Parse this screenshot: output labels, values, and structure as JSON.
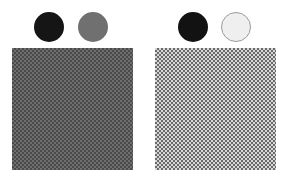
{
  "left_group": {
    "swatch_a": {
      "color": "#151515",
      "label": "dark swatch"
    },
    "swatch_b": {
      "color": "#707070",
      "label": "mid-gray swatch"
    },
    "pattern": {
      "foreground": "#4a4a4a",
      "background": "#6e6e6e",
      "type": "checkerboard"
    }
  },
  "right_group": {
    "swatch_a": {
      "color": "#121212",
      "label": "dark swatch"
    },
    "swatch_b": {
      "color": "#efefef",
      "border": "#9a9a9a",
      "label": "light swatch"
    },
    "pattern": {
      "foreground": "#6a6a6a",
      "background": "#d8d8d8",
      "type": "checkerboard"
    }
  }
}
